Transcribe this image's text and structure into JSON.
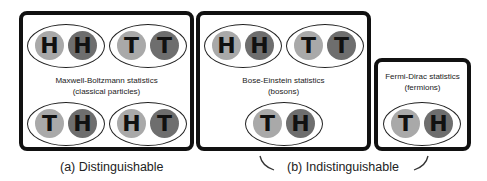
{
  "boxes": {
    "maxwell": {
      "label_line1": "Maxwell-Boltzmann statistics",
      "label_line2": "(classical particles)",
      "pairs": [
        {
          "left": "H",
          "right": "H"
        },
        {
          "left": "T",
          "right": "T"
        },
        {
          "left": "T",
          "right": "H"
        },
        {
          "left": "H",
          "right": "T"
        }
      ]
    },
    "bose": {
      "label_line1": "Bose-Einstein statistics",
      "label_line2": "(bosons)",
      "pairs": [
        {
          "left": "H",
          "right": "H"
        },
        {
          "left": "T",
          "right": "T"
        },
        {
          "left": "T",
          "right": "H"
        }
      ]
    },
    "fermi": {
      "label_line1": "Fermi-Dirac statistics",
      "label_line2": "(fermions)",
      "pairs": [
        {
          "left": "T",
          "right": "H"
        }
      ]
    }
  },
  "captions": {
    "a": "(a) Distinguishable",
    "b": "(b) Indistinguishable"
  },
  "colors": {
    "light_ball": "#a9a9a9",
    "dark_ball": "#6e6e6e",
    "border": "#111111"
  }
}
